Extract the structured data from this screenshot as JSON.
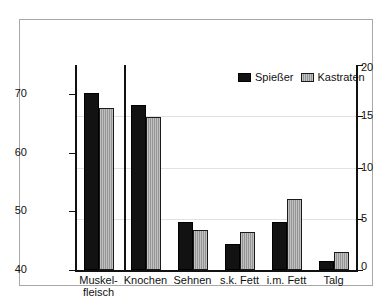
{
  "chart_data": {
    "type": "bar",
    "title": "",
    "subtitle": "",
    "xlabel": "",
    "ylabel": "",
    "grid": true,
    "legend_position": "top-right",
    "categories": [
      "Muskel-\nfleisch",
      "Knochen",
      "Sehnen",
      "s.k. Fett",
      "i.m. Fett",
      "Talg"
    ],
    "series": [
      {
        "name": "Spießer",
        "values": [
          70.2,
          68.1,
          4.7,
          2.5,
          4.7,
          0.9
        ]
      },
      {
        "name": "Kastraten",
        "values": [
          67.6,
          66.2,
          3.9,
          3.7,
          6.9,
          1.8
        ]
      }
    ],
    "axes": [
      {
        "name": "left-axis",
        "side": "left",
        "applies_to_categories": [
          "Muskel-\nfleisch",
          "Knochen"
        ],
        "ticks": [
          40,
          50,
          60,
          70
        ],
        "tick_labels": [
          "40",
          "50",
          "60",
          "70"
        ],
        "ylim": [
          40,
          75
        ]
      },
      {
        "name": "right-axis",
        "side": "right",
        "applies_to_categories": [
          "Sehnen",
          "s.k. Fett",
          "i.m. Fett",
          "Talg"
        ],
        "ticks": [
          0,
          5,
          10,
          15,
          20
        ],
        "tick_labels": [
          "0",
          "5",
          "10",
          "15",
          "20"
        ],
        "ylim": [
          0,
          20
        ]
      }
    ],
    "series_colors": [
      "#121212",
      "#a6a6a6"
    ]
  },
  "legend": {
    "entries": [
      {
        "label": "Spießer",
        "swatch": "black-square-swatch"
      },
      {
        "label": "Kastraten",
        "swatch": "gray-hatched-square-swatch"
      }
    ]
  },
  "axis_left": {
    "tick_labels": [
      "70",
      "60",
      "50",
      "40"
    ]
  },
  "axis_right": {
    "tick_labels": [
      "20",
      "15",
      "10",
      "5",
      "0"
    ]
  },
  "categories": {
    "labels": [
      "Muskel-\nfleisch",
      "Knochen",
      "Sehnen",
      "s.k. Fett",
      "i.m. Fett",
      "Talg"
    ]
  }
}
